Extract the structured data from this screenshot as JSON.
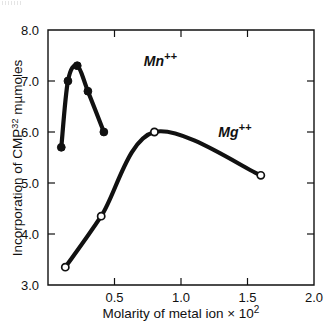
{
  "figure": {
    "background_color": "#ffffff",
    "ink_color": "#111111"
  },
  "axes": {
    "frame": {
      "left_px": 48,
      "right_px": 314,
      "top_px": 30,
      "bottom_px": 285
    },
    "x": {
      "label_main": "Molarity of metal ion",
      "label_mult": "× 10",
      "label_exp": "2",
      "min": 0.0,
      "max": 2.0,
      "ticks": [
        0.5,
        1.0,
        1.5,
        2.0
      ],
      "tick_labels": [
        "0.5",
        "1.0",
        "1.5",
        "2.0"
      ]
    },
    "y": {
      "label_part1": "Incorporation of CMP",
      "label_exp": "32",
      "label_part2": " mµmoles",
      "min": 3.0,
      "max": 8.0,
      "ticks": [
        3.0,
        4.0,
        5.0,
        6.0,
        7.0,
        8.0
      ],
      "tick_labels": [
        "3.0",
        "4.0",
        "5.0",
        "6.0",
        "7.0",
        "8.0"
      ]
    }
  },
  "chart_data": {
    "type": "line",
    "title": "",
    "xlabel": "Molarity of metal ion × 10²",
    "ylabel": "Incorporation of CMP32 mµmoles",
    "xlim": [
      0.0,
      2.0
    ],
    "ylim": [
      3.0,
      8.0
    ],
    "grid": false,
    "legend_position": "inline-annotation",
    "series": [
      {
        "name": "Mn++",
        "label": "Mn",
        "label_superscript": "++",
        "marker": "filled-circle",
        "marker_fill": "#111111",
        "line_color": "#111111",
        "label_x": 0.72,
        "label_y": 7.3,
        "x": [
          0.1,
          0.15,
          0.22,
          0.3,
          0.42
        ],
        "y": [
          5.7,
          7.0,
          7.3,
          6.8,
          6.0
        ]
      },
      {
        "name": "Mg++",
        "label": "Mg",
        "label_superscript": "++",
        "marker": "open-circle",
        "marker_fill": "#ffffff",
        "line_color": "#111111",
        "label_x": 1.28,
        "label_y": 5.9,
        "x": [
          0.13,
          0.4,
          0.8,
          1.6
        ],
        "y": [
          3.35,
          4.35,
          6.0,
          5.15
        ]
      }
    ]
  }
}
